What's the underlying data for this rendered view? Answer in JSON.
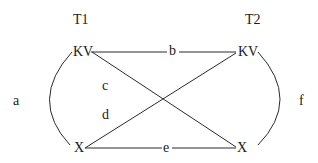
{
  "diagram": {
    "column_headers": {
      "left": "T1",
      "right": "T2"
    },
    "nodes": {
      "top_left": "KV",
      "top_right": "KV",
      "bottom_left": "X",
      "bottom_right": "X"
    },
    "edge_labels": {
      "left_arc": "a",
      "top": "b",
      "diag_down": "c",
      "diag_up": "d",
      "bottom": "e",
      "right_arc": "f"
    },
    "colors": {
      "line": "#2a2a2a",
      "text": "#1a1a1a",
      "background": "#ffffff"
    }
  }
}
